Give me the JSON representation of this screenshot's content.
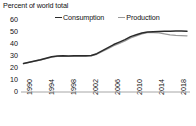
{
  "chart_data": {
    "type": "line",
    "title": "Percent of world total",
    "xlabel": "",
    "ylabel": "",
    "ylim": [
      0,
      60
    ],
    "xlim": [
      1990,
      2019
    ],
    "yticks": [
      0,
      10,
      20,
      30,
      40,
      50,
      60
    ],
    "xticks": [
      1990,
      1994,
      1998,
      2002,
      2006,
      2010,
      2014,
      2018
    ],
    "grid": false,
    "legend_position": "top-center",
    "x": [
      1990,
      1991,
      1992,
      1993,
      1994,
      1995,
      1996,
      1997,
      1998,
      1999,
      2000,
      2001,
      2002,
      2003,
      2004,
      2005,
      2006,
      2007,
      2008,
      2009,
      2010,
      2011,
      2012,
      2013,
      2014,
      2015,
      2016,
      2017,
      2018,
      2019
    ],
    "series": [
      {
        "name": "Consumption",
        "color": "#2b2b2b",
        "values": [
          23.5,
          24.5,
          25.5,
          26.5,
          27.8,
          29.0,
          29.6,
          29.8,
          29.6,
          29.7,
          29.8,
          29.7,
          30.0,
          31.5,
          34.0,
          36.5,
          39.0,
          41.0,
          43.0,
          45.5,
          47.0,
          48.5,
          49.3,
          49.6,
          49.8,
          50.0,
          50.0,
          50.1,
          50.2,
          50.0
        ]
      },
      {
        "name": "Production",
        "color": "#9a9a9a",
        "values": [
          23.3,
          24.3,
          25.3,
          26.3,
          27.5,
          28.7,
          29.3,
          29.5,
          29.3,
          29.4,
          29.5,
          29.4,
          29.7,
          31.0,
          33.3,
          35.6,
          38.0,
          40.0,
          42.0,
          44.5,
          46.2,
          47.8,
          48.8,
          48.8,
          48.6,
          47.8,
          47.0,
          46.6,
          46.4,
          46.2
        ]
      }
    ]
  },
  "legend": {
    "items": [
      {
        "label": "Consumption",
        "color": "#2b2b2b"
      },
      {
        "label": "Production",
        "color": "#9a9a9a"
      }
    ]
  },
  "axes": {
    "y_labels": [
      "60",
      "50",
      "40",
      "30",
      "20",
      "10",
      "0"
    ],
    "x_labels": [
      "1990",
      "1994",
      "1998",
      "2002",
      "2006",
      "2010",
      "2014",
      "2018"
    ]
  },
  "colors": {
    "consumption": "#2b2b2b",
    "production": "#9a9a9a",
    "axis": "#a6a6a6",
    "text": "#111111",
    "background": "#ffffff"
  }
}
